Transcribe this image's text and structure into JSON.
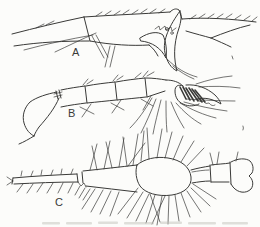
{
  "figure": {
    "ink_color": "#3a3a38",
    "paper_color": "#fcfcfa",
    "smudge_color": "#c3c3bb",
    "panels": [
      {
        "label": "A"
      },
      {
        "label": "B"
      },
      {
        "label": "C"
      }
    ]
  }
}
